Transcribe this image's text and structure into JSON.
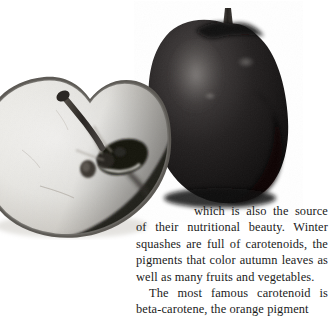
{
  "page": {
    "background_color": "#ffffff",
    "text_color": "#1b1b1b"
  },
  "photo": {
    "caption_alt": "black-and-white photograph of a whole dark apple beside a halved apple showing its core and seeds",
    "whole_apple_label": "whole-apple",
    "halved_apple_label": "halved-apple",
    "stem_label": "apple-stem",
    "seed_label": "apple-seed",
    "core_label": "apple-core",
    "colors": {
      "apple_dark": "#231f20",
      "apple_darker": "#0d0c0c",
      "apple_highlight": "#6e6a68",
      "flesh_light": "#f2f1ee",
      "flesh_shadow": "#c9c6c0",
      "skin_edge": "#8d8a85"
    }
  },
  "body": {
    "paragraph_1": "which is also the source of their nutritional beauty. Winter squashes are full of carotenoids, the pigments that color autumn leaves as well as many fruits and vegetables.",
    "paragraph_2": "The most famous carotenoid is beta-carotene, the orange pigment"
  }
}
